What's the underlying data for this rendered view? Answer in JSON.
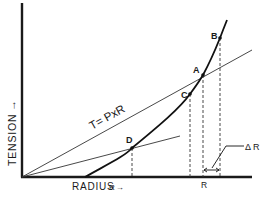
{
  "diagram": {
    "axes": {
      "y_label": "Tension",
      "y_label_display": "TENSION",
      "y_arrow": "→",
      "x_label": "Radius",
      "x_label_display": "RADIUS",
      "x_marker": "R",
      "x_marker_arrow": "→"
    },
    "line_label": "T= PxR",
    "points": [
      {
        "id": "A",
        "label": "A"
      },
      {
        "id": "B",
        "label": "B"
      },
      {
        "id": "C",
        "label": "C"
      },
      {
        "id": "D",
        "label": "D"
      }
    ],
    "annotations": {
      "r_tick_label": "R",
      "delta_r_label": "Δ R"
    },
    "colors": {
      "ink": "#1a1a1a",
      "background": "#ffffff"
    }
  }
}
